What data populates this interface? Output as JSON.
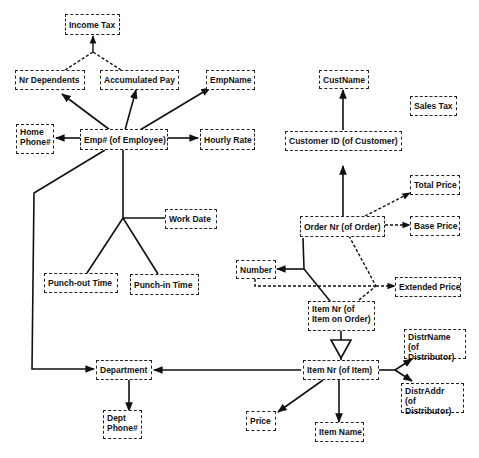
{
  "diagram": {
    "type": "functional-dependency-graph",
    "nodes": {
      "income_tax": "Income Tax",
      "nr_dependents": "Nr Dependents",
      "accumulated_pay": "Accumulated Pay",
      "emp_name": "EmpName",
      "home_phone": "Home\nPhone#",
      "emp_id": "Emp# (of Employee)",
      "hourly_rate": "Hourly Rate",
      "work_date": "Work Date",
      "punch_out_time": "Punch-out Time",
      "punch_in_time": "Punch-in Time",
      "cust_name": "CustName",
      "sales_tax": "Sales Tax",
      "customer_id": "Customer ID (of Customer)",
      "total_price": "Total Price",
      "order_nr": "Order Nr (of Order)",
      "base_price": "Base Price",
      "number": "Number",
      "extended_price": "Extended Price",
      "item_on_order": "Item Nr (of\nItem on Order)",
      "distr_name": "DistrName\n(of Distributor)",
      "department": "Department",
      "item_nr": "Item Nr (of Item)",
      "distr_addr": "DistrAddr\n(of Distributor)",
      "dept_phone": "Dept\nPhone#",
      "price": "Price",
      "item_name": "Item Name"
    },
    "edges": [
      {
        "from": "emp_id",
        "to": "nr_dependents",
        "style": "solid"
      },
      {
        "from": "emp_id",
        "to": "accumulated_pay",
        "style": "solid"
      },
      {
        "from": "emp_id",
        "to": "emp_name",
        "style": "solid"
      },
      {
        "from": "emp_id",
        "to": "home_phone",
        "style": "solid"
      },
      {
        "from": "emp_id",
        "to": "hourly_rate",
        "style": "solid"
      },
      {
        "from": "emp_id",
        "to": "department",
        "style": "solid"
      },
      {
        "from": [
          "nr_dependents",
          "accumulated_pay"
        ],
        "to": "income_tax",
        "style": "dashed"
      },
      {
        "from": [
          "emp_id",
          "work_date",
          "punch_out_time",
          "punch_in_time"
        ],
        "style": "solid",
        "kind": "composite-key"
      },
      {
        "from": "customer_id",
        "to": "cust_name",
        "style": "solid"
      },
      {
        "from": "order_nr",
        "to": "customer_id",
        "style": "solid"
      },
      {
        "from": "order_nr",
        "to": "total_price",
        "style": "dashed"
      },
      {
        "from": "order_nr",
        "to": "base_price",
        "style": "dashed"
      },
      {
        "from": [
          "order_nr",
          "item_on_order"
        ],
        "to": "number",
        "style": "solid"
      },
      {
        "from": [
          "number",
          "order_nr",
          "item_on_order"
        ],
        "to": "extended_price",
        "style": "dashed"
      },
      {
        "from": "item_on_order",
        "to": "item_nr",
        "style": "subtype"
      },
      {
        "from": "item_nr",
        "to": "department",
        "style": "solid"
      },
      {
        "from": "item_nr",
        "to": "distr_name",
        "style": "solid"
      },
      {
        "from": "item_nr",
        "to": "distr_addr",
        "style": "solid"
      },
      {
        "from": "item_nr",
        "to": "price",
        "style": "solid"
      },
      {
        "from": "item_nr",
        "to": "item_name",
        "style": "solid"
      },
      {
        "from": "department",
        "to": "dept_phone",
        "style": "solid"
      }
    ]
  }
}
